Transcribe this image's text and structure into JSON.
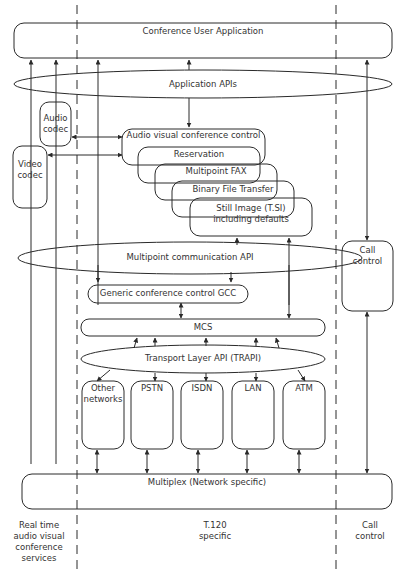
{
  "diagram": {
    "top_box": "Conference User Application",
    "app_apis": "Application APIs",
    "audio_codec": [
      "Audio",
      "codec"
    ],
    "video_codec": [
      "Video",
      "codec"
    ],
    "application_stack": [
      "Audio visual conference control",
      "Reservation",
      "Multipoint FAX",
      "Binary File Transfer",
      "Still Image (T.SI)",
      "including defaults"
    ],
    "mcapi": "Multipoint communication API",
    "gcc": "Generic conference control GCC",
    "mcs": "MCS",
    "trapi": "Transport Layer API (TRAPI)",
    "networks": [
      [
        "Other",
        "networks"
      ],
      [
        "PSTN"
      ],
      [
        "ISDN"
      ],
      [
        "LAN"
      ],
      [
        "ATM"
      ]
    ],
    "call_control": [
      "Call",
      "control"
    ],
    "multiplex": "Multiplex (Network specific)",
    "columns": {
      "left": [
        "Real time",
        "audio visual",
        "conference",
        "services"
      ],
      "middle": [
        "T.120",
        "specific"
      ],
      "right": [
        "Call",
        "control"
      ]
    },
    "stroke_color": "#2a2a2a"
  }
}
